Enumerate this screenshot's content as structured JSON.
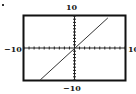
{
  "chart_data": {
    "type": "line",
    "title": "",
    "xlabel": "",
    "ylabel": "",
    "xlim": [
      -10,
      10
    ],
    "ylim": [
      -10,
      10
    ],
    "xscale_ticks": 1,
    "yscale_ticks": 1,
    "grid": false,
    "series": [
      {
        "name": "line",
        "x": [
          -6.8,
          6.6
        ],
        "y": [
          -10,
          9.4
        ]
      }
    ],
    "tick_labels": {
      "xmin": "−10",
      "xmax": "10",
      "ymin": "−10",
      "ymax": "10"
    }
  },
  "labels": {
    "ymax": "10",
    "ymin": "−10",
    "xmin": "−10",
    "xmax": "10"
  },
  "colors": {
    "frame": "#111111",
    "axis": "#222222",
    "line": "#333333"
  }
}
